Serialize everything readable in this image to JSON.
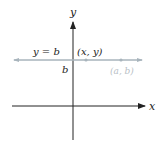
{
  "diagram": {
    "axis_x_label": "x",
    "axis_y_label": "y",
    "line_label": "y = b",
    "point_label": "(x, y)",
    "intercept_label": "b",
    "fixed_point_label": "(a, b)",
    "colors": {
      "axis": "#222222",
      "line": "#a8b4bc",
      "faded_label": "#b8c0c6"
    }
  }
}
